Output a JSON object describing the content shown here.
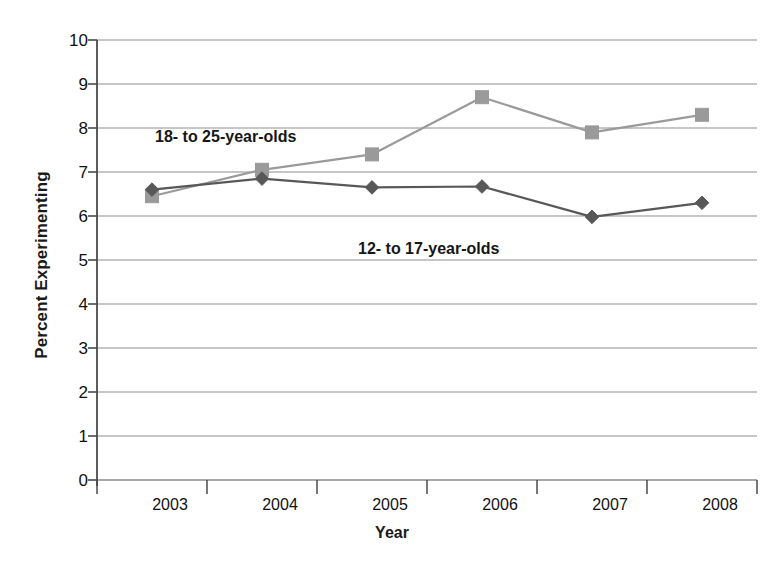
{
  "chart_data": {
    "type": "line",
    "title": "",
    "xlabel": "Year",
    "ylabel": "Percent Experimenting",
    "categories": [
      "2003",
      "2004",
      "2005",
      "2006",
      "2007",
      "2008"
    ],
    "x": [
      2003,
      2004,
      2005,
      2006,
      2007,
      2008
    ],
    "ylim": [
      0,
      10
    ],
    "yticks": [
      "0",
      "1",
      "2",
      "3",
      "4",
      "5",
      "6",
      "7",
      "8",
      "9",
      "10"
    ],
    "grid": true,
    "legend_position": "inline-annotations",
    "series": [
      {
        "name": "18- to 25-year-olds",
        "values": [
          6.45,
          7.05,
          7.4,
          8.7,
          7.9,
          8.3
        ],
        "color": "#9a9a9a",
        "marker": "square",
        "annotation": "18- to 25-year-olds"
      },
      {
        "name": "12- to 17-year-olds",
        "values": [
          6.6,
          6.85,
          6.65,
          6.67,
          5.98,
          6.3
        ],
        "color": "#585858",
        "marker": "diamond",
        "annotation": "12- to 17-year-olds"
      }
    ]
  },
  "axes": {
    "y_title": "Percent Experimenting",
    "x_title": "Year",
    "axis_color": "#4a4a4a",
    "grid_color": "#8d8d8d"
  }
}
